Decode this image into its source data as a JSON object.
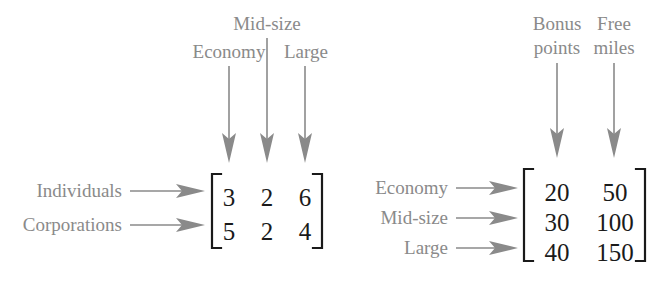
{
  "figure": {
    "label_color": "#8a8a8a",
    "number_color": "#1a1a1a",
    "background_color": "#ffffff"
  },
  "left_matrix": {
    "column_labels": [
      "Economy",
      "Mid-size",
      "Large"
    ],
    "row_labels": [
      "Individuals",
      "Corporations"
    ],
    "rows": [
      [
        "3",
        "2",
        "6"
      ],
      [
        "5",
        "2",
        "4"
      ]
    ]
  },
  "right_matrix": {
    "column_labels": [
      {
        "line1": "Bonus",
        "line2": "points"
      },
      {
        "line1": "Free",
        "line2": "miles"
      }
    ],
    "row_labels": [
      "Economy",
      "Mid-size",
      "Large"
    ],
    "rows": [
      [
        "20",
        "50"
      ],
      [
        "30",
        "100"
      ],
      [
        "40",
        "150"
      ]
    ]
  }
}
